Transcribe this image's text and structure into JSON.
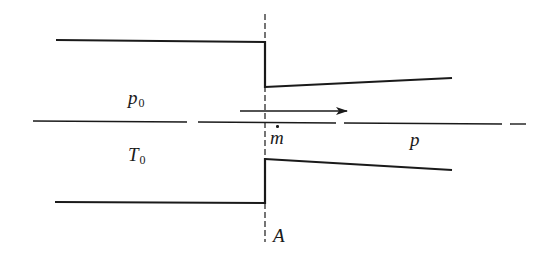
{
  "diagram": {
    "colors": {
      "stroke": "#1a1a1a",
      "background": "#ffffff"
    },
    "labels": {
      "stagnation_pressure": {
        "symbol": "p",
        "subscript": "0"
      },
      "stagnation_temperature": {
        "symbol": "T",
        "subscript": "0"
      },
      "mass_flow": {
        "symbol": "m",
        "accent": "dot"
      },
      "downstream_pressure": {
        "symbol": "p"
      },
      "area": {
        "symbol": "A"
      }
    },
    "geometry": {
      "upper_left_wall": [
        [
          56,
          40
        ],
        [
          265,
          42
        ]
      ],
      "lower_left_wall": [
        [
          55,
          202
        ],
        [
          265,
          203
        ]
      ],
      "upper_step": [
        [
          265,
          42
        ],
        [
          265,
          87
        ]
      ],
      "lower_step": [
        [
          265,
          159
        ],
        [
          265,
          203
        ]
      ],
      "upper_right_wall": [
        [
          265,
          87
        ],
        [
          452,
          78
        ]
      ],
      "lower_right_wall": [
        [
          265,
          159
        ],
        [
          452,
          170
        ]
      ],
      "section_line_x": 265,
      "centerline_y": 122,
      "flow_arrow": [
        [
          240,
          111
        ],
        [
          347,
          111
        ]
      ]
    }
  }
}
